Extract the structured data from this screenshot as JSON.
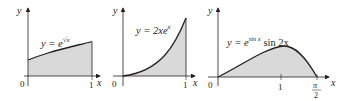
{
  "panels": [
    {
      "id": "panel-1",
      "equation_prefix": "y = e",
      "equation_exponent": "√x",
      "x_axis_label": "x",
      "y_axis_label": "y",
      "origin_label": "0",
      "x_tick_labels": [
        "1"
      ]
    },
    {
      "id": "panel-2",
      "equation": "y = 2xe",
      "equation_exponent": "x",
      "x_axis_label": "x",
      "y_axis_label": "y",
      "origin_label": "0",
      "x_tick_labels": [
        "1"
      ]
    },
    {
      "id": "panel-3",
      "equation_prefix": "y = e",
      "equation_exponent": "sin x",
      "equation_suffix": " sin 2x",
      "x_axis_label": "x",
      "y_axis_label": "y",
      "origin_label": "0",
      "x_tick_labels": [
        "1"
      ],
      "pi_label_num": "π",
      "pi_label_den": "2"
    }
  ],
  "colors": {
    "fill": "#d9d9d9",
    "stroke": "#231f20",
    "axis": "#231f20"
  }
}
